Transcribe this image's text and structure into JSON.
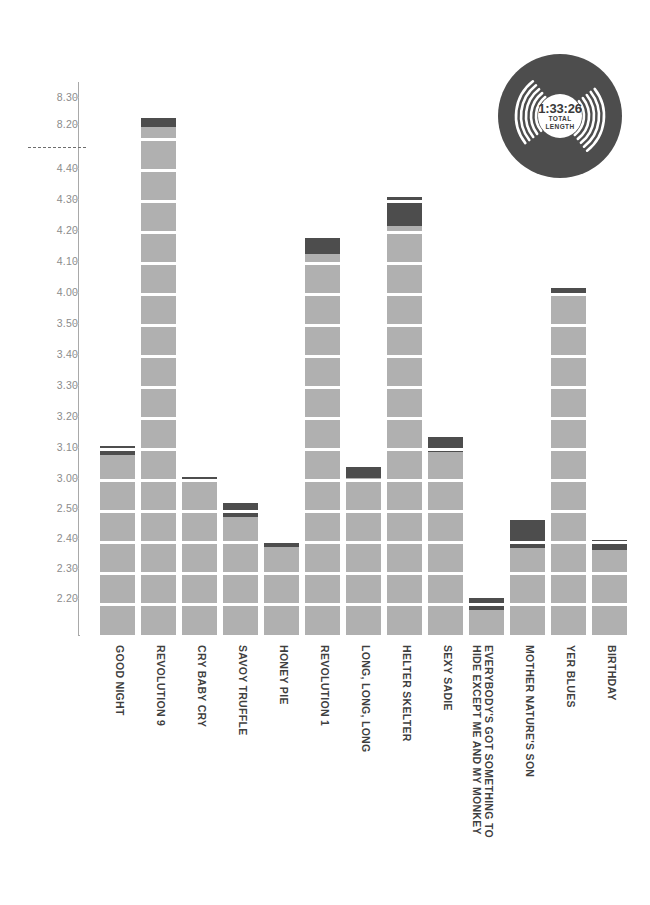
{
  "chart_data": {
    "type": "bar",
    "title": "",
    "subtitle": "",
    "xlabel": "",
    "ylabel": "",
    "grid": false,
    "legend_position": "none",
    "axis_break": {
      "present": true,
      "between": [
        "4.40",
        "8.20"
      ],
      "style": "dashed"
    },
    "ytick_labels": [
      "8.30",
      "8.20",
      "4.40",
      "4.30",
      "4.20",
      "4.10",
      "4.00",
      "3.50",
      "3.40",
      "3.30",
      "3.20",
      "3.10",
      "3.00",
      "2.50",
      "2.40",
      "2.30",
      "2.20"
    ],
    "ytick_y": [
      97,
      124,
      168,
      199,
      230,
      261,
      292,
      323,
      354,
      385,
      416,
      447,
      478,
      508,
      538,
      568,
      598
    ],
    "baseline_y": 635,
    "axis_top_y": 82,
    "segment_step_seconds": 10,
    "categories": [
      "GOOD NIGHT",
      "REVOLUTION 9",
      "CRY BABY CRY",
      "SAVOY TRUFFLE",
      "HONEY PIE",
      "REVOLUTION 1",
      "LONG, LONG, LONG",
      "HELTER SKELTER",
      "SEXY SADIE",
      "EVERYBODY'S GOT SOMETHING TO\nHIDE EXCEPT ME AND MY MONKEY",
      "MOTHER NATURE'S SON",
      "YER BLUES",
      "BIRTHDAY"
    ],
    "values": [
      "3.11",
      "8.22",
      "3.01",
      "2.54",
      "2.41",
      "4.15",
      "3.04",
      "4.29",
      "3.15",
      "2.24",
      "2.48",
      "4.01",
      "2.42"
    ],
    "bars": [
      {
        "label": "GOOD NIGHT",
        "value": "3.11",
        "top": 446,
        "cap_height": 9,
        "x": 100
      },
      {
        "label": "REVOLUTION 9",
        "value": "8.22",
        "top": 118,
        "cap_height": 9,
        "x": 141
      },
      {
        "label": "CRY BABY CRY",
        "value": "3.01",
        "top": 477,
        "cap_height": 5,
        "x": 182
      },
      {
        "label": "SAVOY TRUFFLE",
        "value": "2.54",
        "top": 503,
        "cap_height": 14,
        "x": 223
      },
      {
        "label": "HONEY PIE",
        "value": "2.41",
        "top": 543,
        "cap_height": 4,
        "x": 264
      },
      {
        "label": "REVOLUTION 1",
        "value": "4.15",
        "top": 238,
        "cap_height": 16,
        "x": 305
      },
      {
        "label": "LONG, LONG, LONG",
        "value": "3.04",
        "top": 467,
        "cap_height": 11,
        "x": 346
      },
      {
        "label": "HELTER SKELTER",
        "value": "4.29",
        "top": 197,
        "cap_height": 29,
        "x": 387
      },
      {
        "label": "SEXY SADIE",
        "value": "3.15",
        "top": 437,
        "cap_height": 15,
        "x": 428
      },
      {
        "label": "EVERYBODY'S GOT SOMETHING TO HIDE EXCEPT ME AND MY MONKEY",
        "value": "2.24",
        "top": 598,
        "cap_height": 12,
        "x": 469
      },
      {
        "label": "MOTHER NATURE'S SON",
        "value": "2.48",
        "top": 520,
        "cap_height": 28,
        "x": 510
      },
      {
        "label": "YER BLUES",
        "value": "4.01",
        "top": 288,
        "cap_height": 5,
        "x": 551
      },
      {
        "label": "BIRTHDAY",
        "value": "2.42",
        "top": 540,
        "cap_height": 10,
        "x": 592
      }
    ]
  },
  "record": {
    "total_time": "1:33:26",
    "caption_line1": "TOTAL",
    "caption_line2": "LENGTH"
  },
  "colors": {
    "bar_fill": "#b0b0b0",
    "bar_cap": "#4d4d4d",
    "axis": "#a9a9a9",
    "tick_text": "#8c8c8c",
    "label_text": "#3f3f3f",
    "record_dark": "#4d4d4d",
    "background": "#ffffff"
  }
}
